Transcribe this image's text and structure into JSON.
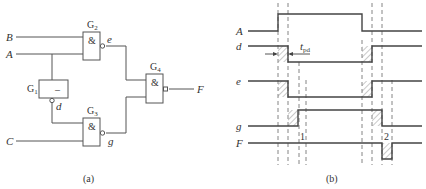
{
  "circuit": {
    "caption": "(a)",
    "inputs": [
      "B",
      "A",
      "C"
    ],
    "output": "F",
    "gates": [
      {
        "id": "G1",
        "label": "G",
        "sub": "1",
        "symbol": "–",
        "type": "NOT"
      },
      {
        "id": "G2",
        "label": "G",
        "sub": "2",
        "symbol": "&",
        "type": "NAND"
      },
      {
        "id": "G3",
        "label": "G",
        "sub": "3",
        "symbol": "&",
        "type": "NAND"
      },
      {
        "id": "G4",
        "label": "G",
        "sub": "4",
        "symbol": "&",
        "type": "NAND"
      }
    ],
    "nets": {
      "e": "e",
      "d": "d",
      "g": "g"
    }
  },
  "timing": {
    "caption": "(b)",
    "signals": [
      "A",
      "d",
      "e",
      "g",
      "F"
    ],
    "tpd_label": "t",
    "tpd_sub": "pd",
    "glitch_markers": [
      "1",
      "2"
    ]
  }
}
